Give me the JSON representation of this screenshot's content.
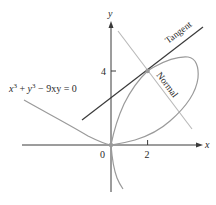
{
  "diagram": {
    "equation_label": {
      "x": "x",
      "exp1": "3",
      "plus": " + ",
      "y": "y",
      "exp2": "3",
      "rest": " − 9xy = 0"
    },
    "axes": {
      "x_label": "x",
      "y_label": "y",
      "origin_label": "0",
      "x_tick_label": "2",
      "y_tick_label": "4"
    },
    "lines": {
      "tangent_label": "Tangent",
      "normal_label": "Normal"
    },
    "point": {
      "x": 2,
      "y": 4
    },
    "colors": {
      "curve": "#9a9a9a",
      "tangent": "#3a3a3a",
      "normal": "#b8b8b8",
      "axes": "#3a3a3a",
      "point": "#9a9a9a"
    }
  }
}
